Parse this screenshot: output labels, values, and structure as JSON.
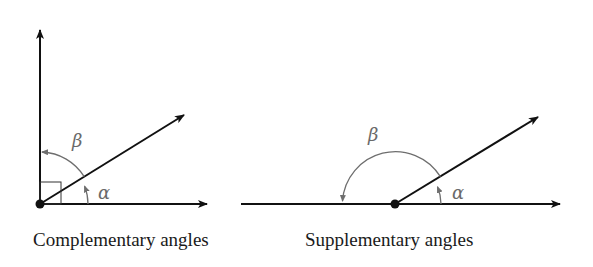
{
  "figures": [
    {
      "id": "complementary",
      "caption": "Complementary angles",
      "labels": {
        "alpha": "α",
        "beta": "β"
      },
      "right_angle_marker": true
    },
    {
      "id": "supplementary",
      "caption": "Supplementary angles",
      "labels": {
        "alpha": "α",
        "beta": "β"
      },
      "right_angle_marker": false
    }
  ],
  "colors": {
    "ray": "#111111",
    "arc": "#6e6e6e",
    "label": "#6a6a6a",
    "background": "#ffffff"
  }
}
